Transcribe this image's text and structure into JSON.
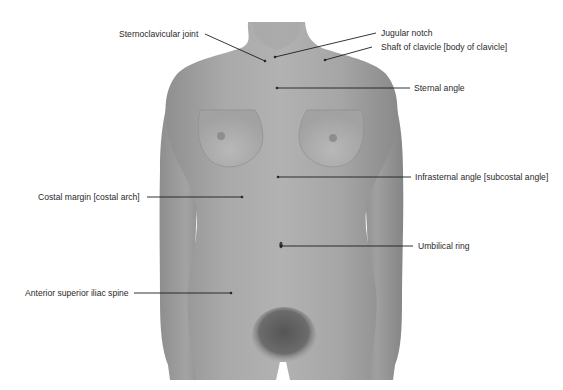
{
  "figure": {
    "colors": {
      "background": "#ffffff",
      "skin_light": "#b4b4b4",
      "skin_mid": "#9f9f9f",
      "skin_dark": "#858585",
      "pubic_hair": "#5a5a5a",
      "leader_line": "#1e1e1e",
      "label_text": "#2a2a2a"
    }
  },
  "labels": [
    {
      "id": "sternoclavicular-joint",
      "text": "Sternoclavicular joint",
      "side": "left",
      "text_x": 119,
      "text_y": 29,
      "line": [
        [
          205,
          34
        ],
        [
          265,
          61
        ]
      ]
    },
    {
      "id": "jugular-notch",
      "text": "Jugular notch",
      "side": "right",
      "text_x": 381,
      "text_y": 29,
      "line": [
        [
          376,
          33
        ],
        [
          275,
          57
        ]
      ]
    },
    {
      "id": "shaft-of-clavicle",
      "text": "Shaft of clavicle [body of clavicle]",
      "side": "right",
      "text_x": 381,
      "text_y": 42,
      "line": [
        [
          372,
          47
        ],
        [
          325,
          60
        ]
      ]
    },
    {
      "id": "sternal-angle",
      "text": "Sternal angle",
      "side": "right",
      "text_x": 414,
      "text_y": 84,
      "line": [
        [
          410,
          88
        ],
        [
          277,
          88
        ]
      ]
    },
    {
      "id": "infrasternal-angle",
      "text": "Infrasternal angle [subcostal angle]",
      "side": "right",
      "text_x": 415,
      "text_y": 173,
      "line": [
        [
          411,
          177
        ],
        [
          278,
          177
        ]
      ]
    },
    {
      "id": "costal-margin",
      "text": "Costal margin [costal arch]",
      "side": "left",
      "text_x": 38,
      "text_y": 192,
      "line": [
        [
          147,
          197
        ],
        [
          242,
          197
        ]
      ]
    },
    {
      "id": "umbilical-ring",
      "text": "Umbilical ring",
      "side": "right",
      "text_x": 418,
      "text_y": 241,
      "line": [
        [
          413,
          246
        ],
        [
          281,
          246
        ]
      ]
    },
    {
      "id": "anterior-superior-iliac-spine",
      "text": "Anterior superior iliac spine",
      "side": "left",
      "text_x": 25,
      "text_y": 289,
      "line": [
        [
          134,
          293
        ],
        [
          231,
          293
        ]
      ]
    }
  ]
}
